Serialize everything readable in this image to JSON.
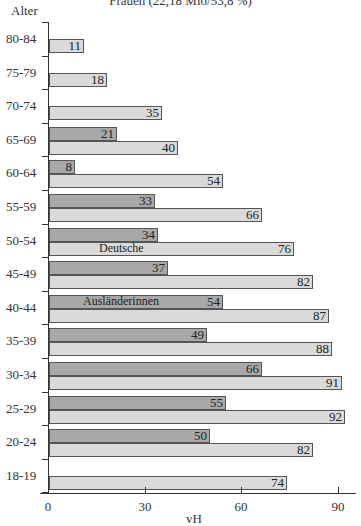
{
  "chart_data": {
    "type": "bar",
    "orientation": "horizontal",
    "title": "Frauen (22,18 Mio/53,8 %)",
    "ylabel": "Alter",
    "xlabel": "vH",
    "xlim": [
      0,
      95
    ],
    "xticks": [
      0,
      30,
      60,
      90
    ],
    "grid": false,
    "categories": [
      "80-84",
      "75-79",
      "70-74",
      "65-69",
      "60-64",
      "55-59",
      "50-54",
      "45-49",
      "40-44",
      "35-39",
      "30-34",
      "25-29",
      "20-24",
      "18-19"
    ],
    "series": [
      {
        "name": "Ausländerinnen",
        "color": "#a8a8a8",
        "values": [
          null,
          null,
          null,
          21,
          8,
          33,
          34,
          37,
          54,
          49,
          66,
          55,
          50,
          null
        ]
      },
      {
        "name": "Deutsche",
        "color": "#dadada",
        "values": [
          11,
          18,
          35,
          40,
          54,
          66,
          76,
          82,
          87,
          88,
          91,
          92,
          82,
          74
        ]
      }
    ],
    "annotations": [
      {
        "text": "Deutsche",
        "category": "50-54",
        "series": "Deutsche"
      },
      {
        "text": "Ausländerinnen",
        "category": "40-44",
        "series": "Ausländerinnen"
      }
    ]
  },
  "labels": {
    "title": "Frauen (22,18 Mio/53,8 %)",
    "ylabel": "Alter",
    "xlabel": "vH",
    "xticks": [
      "0",
      "30",
      "60",
      "90"
    ],
    "deutsche": "Deutsche",
    "auslaenderinnen": "Ausländerinnen"
  }
}
